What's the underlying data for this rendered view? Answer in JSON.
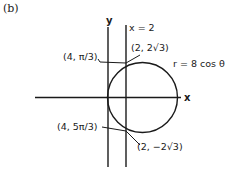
{
  "panel_label": "(b)",
  "axes": {
    "x_label": "x",
    "y_label": "y"
  },
  "vertical_line": {
    "label": "x = 2"
  },
  "curve": {
    "label": "r = 8 cos θ"
  },
  "points": {
    "upper_polar": "(4, π/3)",
    "upper_cartesian": "(2, 2√3)",
    "lower_polar": "(4, 5π/3)",
    "lower_cartesian": "(2, −2√3)"
  },
  "colors": {
    "ink": "#1a1a1a",
    "background": "#ffffff"
  }
}
